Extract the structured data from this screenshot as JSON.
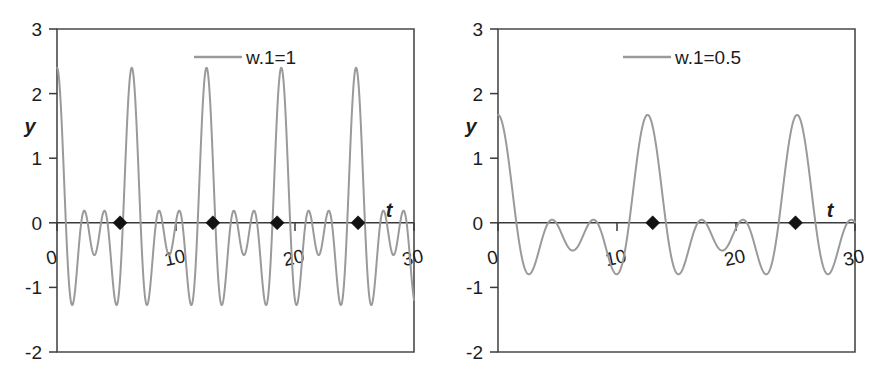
{
  "figure": {
    "panels": [
      {
        "id": "left",
        "legend_label": "w.1=1",
        "xlabel": "t",
        "ylabel": "y"
      },
      {
        "id": "right",
        "legend_label": "w.1=0.5",
        "xlabel": "t",
        "ylabel": "y"
      }
    ],
    "colors": {
      "curve": "#9a9a9a",
      "axis": "#3a3a3a",
      "marker": "#121212",
      "background": "#ffffff"
    }
  },
  "chart_data": [
    {
      "type": "line",
      "title": "",
      "panel": "left",
      "legend": [
        "w.1=1"
      ],
      "legend_position": "top-center",
      "xlabel": "t",
      "ylabel": "y",
      "xlim": [
        0,
        30
      ],
      "ylim": [
        -2,
        3
      ],
      "xticks": [
        0,
        10,
        20,
        30
      ],
      "xtick_labels": [
        "0",
        "10",
        "20",
        "30"
      ],
      "yticks": [
        -2,
        -1,
        0,
        1,
        2,
        3
      ],
      "ytick_labels": [
        "-2",
        "-1",
        "0",
        "1",
        "2",
        "3"
      ],
      "grid": false,
      "series": [
        {
          "name": "w.1=1",
          "color": "#9a9a9a",
          "description": "Beating waveform: sum of sinusoids with carrier frequency w.1=1, amplitude envelope peaking near 2.4 at t = 0, 5.3, 13.1, 18.5, 25.3, minima near -1.3",
          "formula": "y = cos(w1*t) + cos(w2*t) + cos(w3*t), w1 = 1",
          "peak_amplitude": 2.4,
          "trough_amplitude": -1.3,
          "beat_period": 6.3,
          "oscillation_count": 20
        }
      ],
      "markers": {
        "name": "zero-crossing-markers",
        "shape": "diamond",
        "color": "#121212",
        "x": [
          5.3,
          13.1,
          18.5,
          25.3
        ],
        "y": [
          0,
          0,
          0,
          0
        ]
      }
    },
    {
      "type": "line",
      "title": "",
      "panel": "right",
      "legend": [
        "w.1=0.5"
      ],
      "legend_position": "top-center",
      "xlabel": "t",
      "ylabel": "y",
      "xlim": [
        0,
        30
      ],
      "ylim": [
        -2,
        3
      ],
      "xticks": [
        0,
        10,
        20,
        30
      ],
      "xtick_labels": [
        "0",
        "10",
        "20",
        "30"
      ],
      "yticks": [
        -2,
        -1,
        0,
        1,
        2,
        3
      ],
      "ytick_labels": [
        "-2",
        "-1",
        "0",
        "1",
        "2",
        "3"
      ],
      "grid": false,
      "series": [
        {
          "name": "w.1=0.5",
          "color": "#9a9a9a",
          "description": "Beating waveform with carrier frequency w.1=0.5; peaks near 1.6 at t = 0, 13, 25 and deep troughs near -1.55 at t = 6.3 and t = 19",
          "formula": "y = cos(w1*t) + cos(w2*t) + cos(w3*t), w1 = 0.5",
          "peak_amplitude": 1.65,
          "trough_amplitude": -1.55,
          "beat_period": 12.5,
          "oscillation_count": 10
        }
      ],
      "markers": {
        "name": "zero-crossing-markers",
        "shape": "diamond",
        "color": "#121212",
        "x": [
          13.0,
          25.0
        ],
        "y": [
          0,
          0
        ]
      }
    }
  ]
}
